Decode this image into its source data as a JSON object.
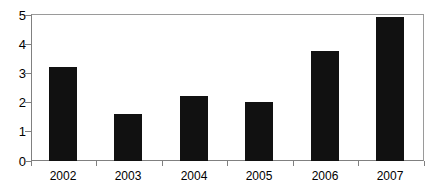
{
  "chart_data": {
    "type": "bar",
    "title": "",
    "subtitle": "",
    "xlabel": "",
    "ylabel": "",
    "categories": [
      "2002",
      "2003",
      "2004",
      "2005",
      "2006",
      "2007"
    ],
    "values": [
      3.2,
      1.6,
      2.2,
      2.0,
      3.75,
      4.9
    ],
    "series": [
      {
        "name": "",
        "values": [
          3.2,
          1.6,
          2.2,
          2.0,
          3.75,
          4.9
        ]
      }
    ],
    "ylim": [
      0,
      5
    ],
    "xlim_categories": 6,
    "yticks": [
      0,
      1,
      2,
      3,
      4,
      5
    ],
    "ytick_labels": [
      "0",
      "1",
      "2",
      "3",
      "4",
      "5"
    ],
    "xtick_labels": [
      "2002",
      "2003",
      "2004",
      "2005",
      "2006",
      "2007"
    ],
    "grid": false,
    "legend": false,
    "legend_position": "none",
    "annotations": [],
    "bar_color": "#111111",
    "axis_color": "#808080",
    "background_color": "#ffffff",
    "text_color": "#000000"
  }
}
